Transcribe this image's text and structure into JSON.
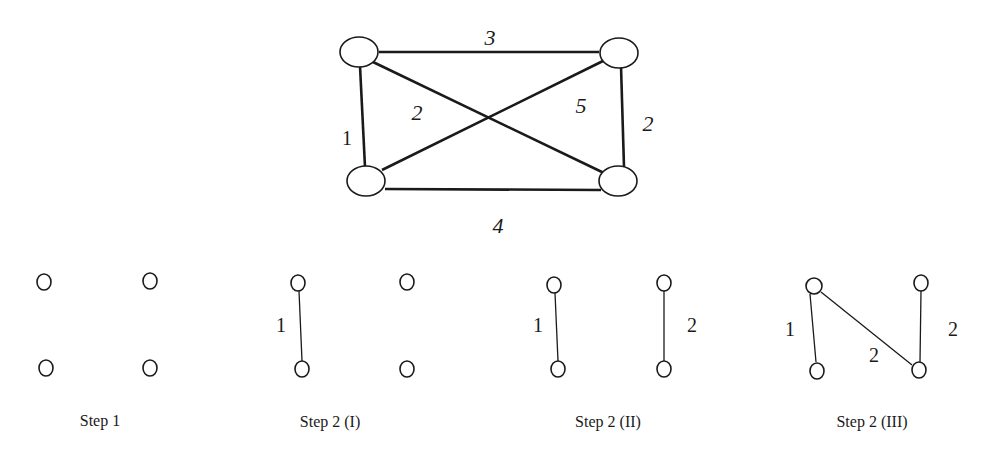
{
  "main_graph": {
    "edges": [
      {
        "from": "top-left",
        "to": "top-right",
        "weight": "3"
      },
      {
        "from": "top-left",
        "to": "bottom-left",
        "weight": "1"
      },
      {
        "from": "top-left",
        "to": "bottom-right",
        "weight": "2"
      },
      {
        "from": "bottom-left",
        "to": "top-right",
        "weight": "5"
      },
      {
        "from": "top-right",
        "to": "bottom-right",
        "weight": "2"
      },
      {
        "from": "bottom-left",
        "to": "bottom-right",
        "weight": "4"
      }
    ]
  },
  "steps": [
    {
      "caption": "Step 1",
      "edges": []
    },
    {
      "caption": "Step 2 (I)",
      "edges": [
        {
          "from": "top-left",
          "to": "bottom-left",
          "weight": "1"
        }
      ]
    },
    {
      "caption": "Step 2 (II)",
      "edges": [
        {
          "from": "top-left",
          "to": "bottom-left",
          "weight": "1"
        },
        {
          "from": "top-right",
          "to": "bottom-right",
          "weight": "2"
        }
      ]
    },
    {
      "caption": "Step 2 (III)",
      "edges": [
        {
          "from": "top-left",
          "to": "bottom-left",
          "weight": "1"
        },
        {
          "from": "top-right",
          "to": "bottom-right",
          "weight": "2"
        },
        {
          "from": "top-left",
          "to": "bottom-right",
          "weight": "2"
        }
      ]
    }
  ]
}
